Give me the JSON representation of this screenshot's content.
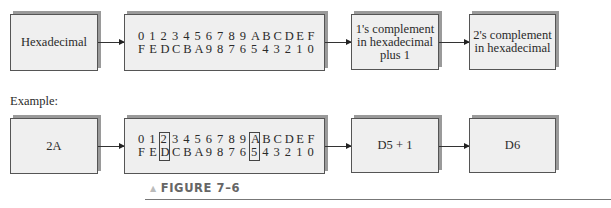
{
  "top_row": {
    "input_label": "Hexadecimal",
    "hex_table": {
      "row1": [
        "0",
        "1",
        "2",
        "3",
        "4",
        "5",
        "6",
        "7",
        "8",
        "9",
        "A",
        "B",
        "C",
        "D",
        "E",
        "F"
      ],
      "row2": [
        "F",
        "E",
        "D",
        "C",
        "B",
        "A",
        "9",
        "8",
        "7",
        "6",
        "5",
        "4",
        "3",
        "2",
        "1",
        "0"
      ]
    },
    "step_label_line1": "1's complement",
    "step_label_line2": "in hexadecimal",
    "step_label_line3": "plus 1",
    "output_label_line1": "2's complement",
    "output_label_line2": "in hexadecimal"
  },
  "example_label": "Example:",
  "bottom_row": {
    "input_label": "2A",
    "hex_table": {
      "row1": [
        "0",
        "1",
        "2",
        "3",
        "4",
        "5",
        "6",
        "7",
        "8",
        "9",
        "A",
        "B",
        "C",
        "D",
        "E",
        "F"
      ],
      "row2": [
        "F",
        "E",
        "D",
        "C",
        "B",
        "A",
        "9",
        "8",
        "7",
        "6",
        "5",
        "4",
        "3",
        "2",
        "1",
        "0"
      ],
      "highlighted_columns": [
        2,
        10
      ]
    },
    "step_label": "D5 + 1",
    "output_label": "D6"
  },
  "caption": {
    "marker": "▲",
    "text": "FIGURE 7–6"
  }
}
